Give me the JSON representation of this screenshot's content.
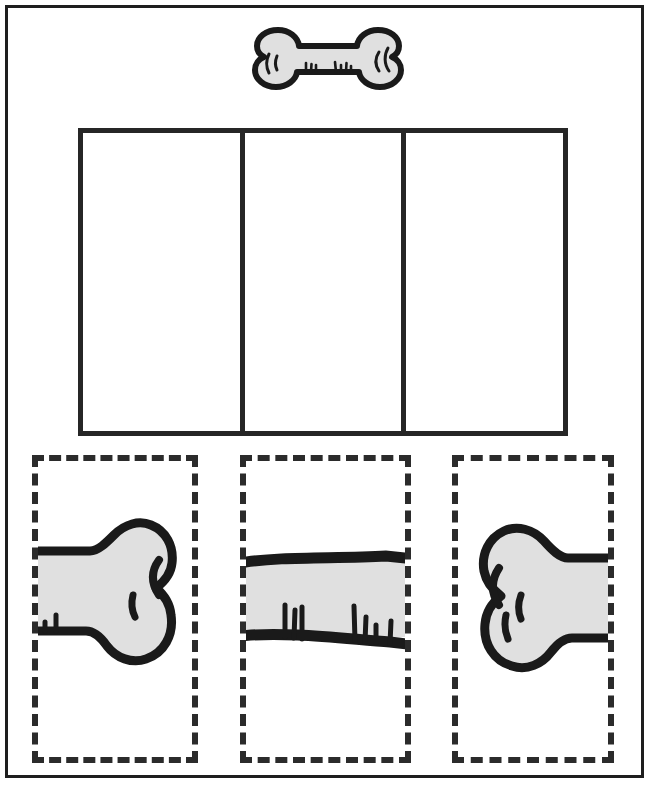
{
  "worksheet": {
    "title": "Bone Puzzle Cut-and-Paste Worksheet",
    "frame_label": "worksheet-border"
  },
  "reference": {
    "label": "Complete bone picture",
    "icon_name": "bone-icon",
    "fill_color": "#e0e0e0",
    "outline_color": "#1a1a1a"
  },
  "answer_area": {
    "label": "Assembly area",
    "cells": [
      {
        "position": "left",
        "label": ""
      },
      {
        "position": "middle",
        "label": ""
      },
      {
        "position": "right",
        "label": ""
      }
    ],
    "border_color": "#262626"
  },
  "pieces": [
    {
      "id": "piece-left",
      "label": "",
      "icon_name": "bone-left-end-icon",
      "description": "left knobbed end of bone",
      "fill_color": "#e0e0e0",
      "outline_color": "#1a1a1a",
      "border_style": "dashed"
    },
    {
      "id": "piece-middle",
      "label": "",
      "icon_name": "bone-shaft-icon",
      "description": "middle shaft of bone with scratch marks",
      "fill_color": "#e0e0e0",
      "outline_color": "#1a1a1a",
      "border_style": "dashed"
    },
    {
      "id": "piece-right",
      "label": "",
      "icon_name": "bone-right-end-icon",
      "description": "right knobbed end of bone",
      "fill_color": "#e0e0e0",
      "outline_color": "#1a1a1a",
      "border_style": "dashed"
    }
  ],
  "colors": {
    "page_background": "#ffffff",
    "bone_fill": "#e0e0e0",
    "ink": "#1a1a1a",
    "frame": "#1e1e1e",
    "dashed_border": "#2b2b2b"
  }
}
